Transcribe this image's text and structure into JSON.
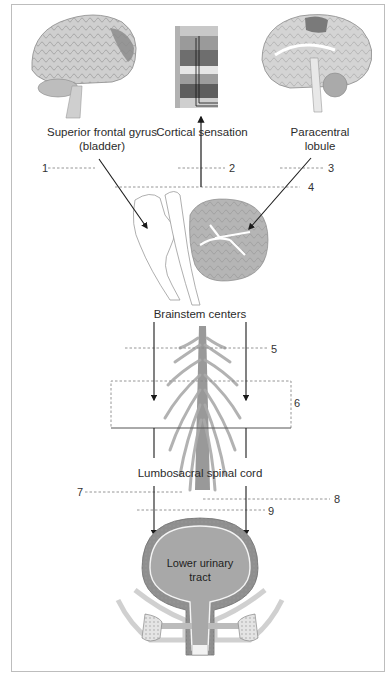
{
  "diagram": {
    "labels": {
      "superior_frontal_gyrus_line1": "Superior frontal gyrus",
      "superior_frontal_gyrus_line2": "(bladder)",
      "cortical_sensation": "Cortical sensation",
      "paracentral_line1": "Paracentral",
      "paracentral_line2": "lobule",
      "brainstem_centers": "Brainstem centers",
      "lumbosacral_spinal_cord": "Lumbosacral spinal cord",
      "lower_urinary_tract_line1": "Lower urinary",
      "lower_urinary_tract_line2": "tract"
    },
    "markers": [
      "1",
      "2",
      "3",
      "4",
      "5",
      "6",
      "7",
      "8",
      "9"
    ],
    "colors": {
      "frame": "#bdbdbd",
      "arrow": "#1a1a1a",
      "dashed": "#8a8a8a",
      "brain_gray": "#c9c9c9",
      "highlight_dark": "#7a7a7a",
      "bladder_fill": "#a8a8a8"
    }
  }
}
